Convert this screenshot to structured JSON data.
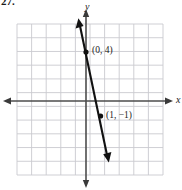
{
  "figure": {
    "problem_number": "27.",
    "axis_labels": {
      "x": "x",
      "y": "y"
    },
    "colors": {
      "grid": "#c9c9cf",
      "axis": "#4d4d4d",
      "line": "#111111",
      "point": "#111111",
      "background": "#ffffff"
    },
    "grid": {
      "columns": 10,
      "rows": 11,
      "cell_px": 14.6,
      "left_px": 17,
      "top_px": 24,
      "right_px": 163,
      "bottom_px": 175
    },
    "origin_px": {
      "x": 86,
      "y": 101
    },
    "unit_px": {
      "x": 14.6,
      "y": 15.0
    }
  },
  "chart_data": {
    "type": "line",
    "title": "",
    "xlabel": "x",
    "ylabel": "y",
    "grid": true,
    "legend": null,
    "xlim": [
      -4.7,
      5.3
    ],
    "ylim": [
      -4.9,
      5.1
    ],
    "points": [
      {
        "label": "(0, 4)",
        "x": 0,
        "y": 4
      },
      {
        "label": "(1, −1)",
        "x": 1,
        "y": -1
      }
    ],
    "series": [
      {
        "name": "line through (0, 4) and (1, -1)",
        "slope": -5,
        "intercept": 4,
        "equation": "y = -5x + 4",
        "x": [
          -0.48,
          1.48
        ],
        "values": [
          6.4,
          -3.4
        ],
        "arrows": [
          "start",
          "end"
        ]
      }
    ]
  }
}
